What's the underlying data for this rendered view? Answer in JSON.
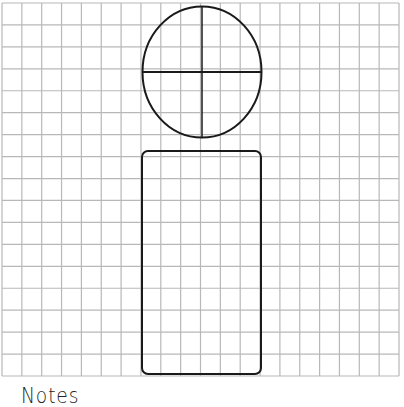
{
  "worksheet": {
    "grid": {
      "columns": 20,
      "rows": 17,
      "left": 2,
      "top": 3,
      "right": 399,
      "bottom": 376,
      "line_color": "#b8b8b8"
    },
    "figure": {
      "head": {
        "shape": "ellipse",
        "cx": 202,
        "cy": 72,
        "rx": 59.5,
        "ry": 65.5,
        "stroke": "#1a1a1a",
        "divided_into_quarters": true
      },
      "body": {
        "shape": "rounded-rectangle",
        "x": 142,
        "y": 151,
        "width": 119,
        "height": 223,
        "corner_radius": 6,
        "stroke": "#1a1a1a"
      }
    },
    "notes_label": "Notes"
  }
}
